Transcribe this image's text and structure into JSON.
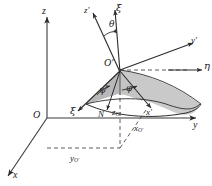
{
  "figure": {
    "type": "euler-angles-3d-diagram",
    "colors": {
      "line": "#2b2b2b",
      "axis": "#3a3a3a",
      "dashed": "#4a4a4a",
      "shade_light": "#c9c9c9",
      "shade_dark": "#a9a9a9",
      "background": "#ffffff"
    },
    "labels": {
      "z_axis": "z",
      "y_axis": "y",
      "x_axis": "x",
      "origin": "O",
      "z_prime_axis": "z'",
      "xi_axis_top": "ξ",
      "xi_axis_lower": "ξ",
      "theta_angle": "θ",
      "psi_angle": "ψ",
      "phi_angle": "φ",
      "origin_prime": "O",
      "origin_prime_mark": "′",
      "y_prime_axis": "y'",
      "x_prime_axis": "x'",
      "eta_axis": "η",
      "node_line": "N",
      "z_offset": "z",
      "z_offset_sub": "O′",
      "x_offset": "x",
      "x_offset_sub": "O′",
      "y_offset": "y",
      "y_offset_sub": "O′"
    }
  }
}
